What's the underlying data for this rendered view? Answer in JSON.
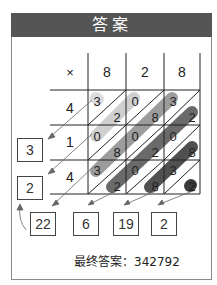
{
  "header": {
    "title": "答案"
  },
  "grid": {
    "corner_symbol": "×",
    "top_digits": [
      "8",
      "2",
      "8"
    ],
    "left_digits": [
      "4",
      "1",
      "4"
    ],
    "cells": [
      [
        {
          "tens": "3",
          "ones": "2"
        },
        {
          "tens": "0",
          "ones": "8"
        },
        {
          "tens": "3",
          "ones": "2"
        }
      ],
      [
        {
          "tens": "0",
          "ones": "8"
        },
        {
          "tens": "0",
          "ones": "2"
        },
        {
          "tens": "0",
          "ones": "8"
        }
      ],
      [
        {
          "tens": "3",
          "ones": "2"
        },
        {
          "tens": "0",
          "ones": "8"
        },
        {
          "tens": "3",
          "ones": "2"
        }
      ]
    ]
  },
  "left_sums": [
    "3",
    "2"
  ],
  "bottom_sums": [
    "22",
    "6",
    "19",
    "2"
  ],
  "final_answer": {
    "label": "最终答案：",
    "value": "342792"
  },
  "colors": {
    "header_bg": "#555555",
    "diag_light": "#d0d0d0",
    "diag_mid": "#9a9a9a",
    "diag_dark": "#555555",
    "diag_darkest": "#333333"
  }
}
